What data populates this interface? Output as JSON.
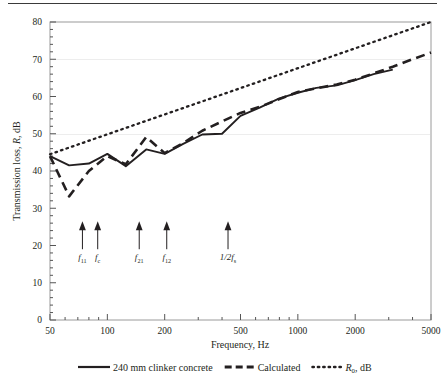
{
  "figure": {
    "top_rule": true,
    "background": "#ffffff",
    "ink": "#231f20"
  },
  "chart_data": {
    "type": "line",
    "title": "",
    "xlabel": "Frequency, Hz",
    "ylabel": "Transmission loss, R, dB",
    "xscale": "log",
    "xlim": [
      50,
      5000
    ],
    "ylim": [
      0,
      80
    ],
    "yticks": [
      0,
      10,
      20,
      30,
      40,
      50,
      60,
      70,
      80
    ],
    "ytick_labels": [
      "0",
      "10",
      "20",
      "30",
      "40",
      "50",
      "60",
      "70",
      "80"
    ],
    "xticks": [
      50,
      100,
      200,
      500,
      1000,
      2000,
      5000
    ],
    "xtick_labels": [
      "50",
      "100",
      "200",
      "500",
      "1000",
      "2000",
      "5000"
    ],
    "grid": false,
    "legend_position": "below",
    "series": [
      {
        "name": "240 mm clinker concrete",
        "style": "solid",
        "color": "#231f20",
        "x": [
          50,
          63,
          80,
          100,
          125,
          160,
          200,
          250,
          315,
          400,
          500,
          630,
          800,
          1000,
          1250,
          1600,
          2000,
          2500,
          3150
        ],
        "y": [
          44.0,
          41.5,
          42.0,
          44.6,
          41.3,
          45.8,
          44.6,
          47.3,
          49.8,
          50.0,
          54.8,
          57.0,
          59.5,
          61.0,
          62.3,
          63.0,
          64.4,
          66.0,
          67.2
        ]
      },
      {
        "name": "Calculated",
        "style": "dashed",
        "color": "#231f20",
        "x": [
          50,
          63,
          80,
          100,
          125,
          160,
          200,
          250,
          315,
          400,
          500,
          630,
          800,
          1000,
          1250,
          1600,
          2000,
          2500,
          3150,
          4000,
          5000
        ],
        "y": [
          44.0,
          33.2,
          40.0,
          44.0,
          41.8,
          49.1,
          44.8,
          47.5,
          50.8,
          53.3,
          55.6,
          57.2,
          59.3,
          61.2,
          62.2,
          63.2,
          64.5,
          66.2,
          68.0,
          70.0,
          71.8
        ]
      },
      {
        "name": "R0, dB",
        "label_html": "R<sub>0</sub>, dB",
        "style": "dotted",
        "color": "#231f20",
        "x": [
          50,
          5000
        ],
        "y": [
          44.5,
          80.0
        ]
      }
    ],
    "annotations": [
      {
        "name": "f11",
        "label_main": "f",
        "label_sub": "11",
        "freq": 74,
        "arrow_top_y": 26,
        "arrow_base_y": 19
      },
      {
        "name": "fc",
        "label_main": "f",
        "label_sub": "c",
        "freq": 89,
        "arrow_top_y": 26,
        "arrow_base_y": 19
      },
      {
        "name": "f21",
        "label_main": "f",
        "label_sub": "21",
        "freq": 147,
        "arrow_top_y": 26,
        "arrow_base_y": 19
      },
      {
        "name": "f12",
        "label_main": "f",
        "label_sub": "12",
        "freq": 205,
        "arrow_top_y": 26,
        "arrow_base_y": 19
      },
      {
        "name": "half-fs",
        "label_main": "1/2f",
        "label_sub": "s",
        "freq": 430,
        "arrow_top_y": 26,
        "arrow_base_y": 19
      }
    ]
  },
  "legend": {
    "items": [
      {
        "label": "240 mm clinker concrete",
        "style": "solid"
      },
      {
        "label": "Calculated",
        "style": "dashed"
      },
      {
        "label": "R",
        "sub": "0",
        "suffix": ", dB",
        "style": "dotted"
      }
    ]
  },
  "axis": {
    "xlabel": "Frequency, Hz",
    "ylabel_pre": "Transmission loss, ",
    "ylabel_italic": "R",
    "ylabel_post": ", dB"
  }
}
